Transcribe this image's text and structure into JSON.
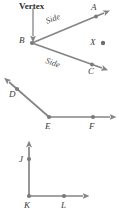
{
  "figure": {
    "type": "geometry-diagram",
    "background_color": "#ffffff",
    "stroke_color": "#808080",
    "label_color": "#3a3a3a",
    "annotations": {
      "vertex_label": "Vertex",
      "side_label_upper": "Side",
      "side_label_lower": "Side"
    },
    "diagrams": [
      {
        "name": "angle-abc",
        "vertex": "B",
        "points": [
          {
            "label": "A",
            "x": 96,
            "y": 17,
            "role": "ray-endpoint"
          },
          {
            "label": "B",
            "x": 32,
            "y": 43,
            "role": "vertex"
          },
          {
            "label": "C",
            "x": 93,
            "y": 64,
            "role": "ray-endpoint"
          }
        ],
        "rays": [
          {
            "from": "B",
            "to": "A",
            "arrow": true
          },
          {
            "from": "B",
            "to": "C",
            "arrow": true
          }
        ]
      },
      {
        "name": "isolated-point-x",
        "points": [
          {
            "label": "X",
            "x": 103,
            "y": 43,
            "role": "standalone-point"
          }
        ]
      },
      {
        "name": "angle-def",
        "vertex": "E",
        "points": [
          {
            "label": "D",
            "x": 17,
            "y": 89,
            "role": "ray-endpoint"
          },
          {
            "label": "E",
            "x": 49,
            "y": 117,
            "role": "vertex"
          },
          {
            "label": "F",
            "x": 93,
            "y": 117,
            "role": "ray-endpoint"
          }
        ],
        "rays": [
          {
            "from": "E",
            "to": "D",
            "arrow": true
          },
          {
            "from": "E",
            "to": "F",
            "arrow": true
          }
        ]
      },
      {
        "name": "angle-jkl",
        "vertex": "K",
        "points": [
          {
            "label": "J",
            "x": 29,
            "y": 159,
            "role": "ray-endpoint"
          },
          {
            "label": "K",
            "x": 29,
            "y": 196,
            "role": "vertex"
          },
          {
            "label": "L",
            "x": 64,
            "y": 196,
            "role": "ray-endpoint"
          }
        ],
        "rays": [
          {
            "from": "K",
            "to": "J",
            "arrow": true
          },
          {
            "from": "K",
            "to": "L",
            "arrow": true
          }
        ]
      }
    ],
    "point_labels": {
      "A": "A",
      "B": "B",
      "C": "C",
      "X": "X",
      "D": "D",
      "E": "E",
      "F": "F",
      "J": "J",
      "K": "K",
      "L": "L"
    }
  }
}
